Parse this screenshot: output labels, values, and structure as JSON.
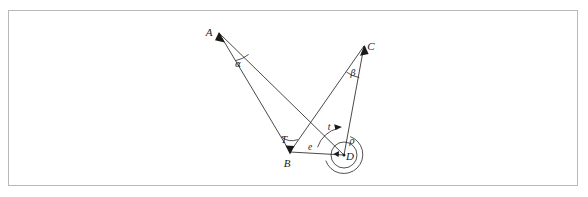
{
  "figure": {
    "type": "geometry-diagram",
    "title": "",
    "frame": {
      "visible": true,
      "color": "#b9b9b9"
    },
    "background": "#ffffff",
    "ink_color": "#1a1a1a"
  },
  "points": [
    {
      "id": "A",
      "label": "A",
      "x": 219,
      "y": 33,
      "label_x": 209,
      "label_y": 36,
      "marker": "arrowhead"
    },
    {
      "id": "C",
      "label": "C",
      "x": 364,
      "y": 46,
      "label_x": 371,
      "label_y": 50,
      "marker": "arrowhead"
    },
    {
      "id": "B",
      "label": "B",
      "x": 290,
      "y": 152,
      "label_x": 287,
      "label_y": 167,
      "marker": "arrowhead"
    },
    {
      "id": "D",
      "label": "D",
      "x": 344,
      "y": 155,
      "label_x": 346,
      "label_y": 160,
      "marker": "dot"
    }
  ],
  "segments": [
    {
      "id": "AB",
      "from": "A",
      "to": "B"
    },
    {
      "id": "AD",
      "from": "A",
      "to": "D"
    },
    {
      "id": "CB",
      "from": "C",
      "to": "B"
    },
    {
      "id": "CD",
      "from": "C",
      "to": "D"
    },
    {
      "id": "BD",
      "from": "B",
      "to": "D"
    }
  ],
  "angles": [
    {
      "id": "alpha",
      "label": "α",
      "vertex": "A",
      "label_x": 238,
      "label_y": 67,
      "arc": true
    },
    {
      "id": "beta",
      "label": "β",
      "vertex": "C",
      "label_x": 353,
      "label_y": 76,
      "arc": true
    },
    {
      "id": "T",
      "label": "T",
      "vertex": "B",
      "label_x": 284,
      "label_y": 143,
      "arc": true
    },
    {
      "id": "rho",
      "label": "ρ",
      "vertex": "D",
      "label_x": 352,
      "label_y": 144,
      "arc": true
    },
    {
      "id": "t",
      "label": "t",
      "vertex": "D",
      "label_x": 329,
      "label_y": 130,
      "arc": true
    }
  ],
  "distances": [
    {
      "id": "e",
      "label": "e",
      "from": "B",
      "to": "D",
      "label_x": 310,
      "label_y": 150
    }
  ],
  "circles": [
    {
      "id": "D-circle",
      "center": "D",
      "cx": 344,
      "cy": 155,
      "r": 13
    }
  ]
}
